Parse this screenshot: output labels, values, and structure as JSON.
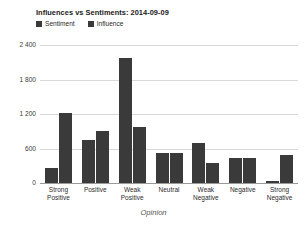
{
  "chart_data": {
    "type": "bar",
    "title": "Influences vs Sentiments: 2014-09-09",
    "xlabel": "Opinion",
    "ylabel": "",
    "ylim": [
      0,
      2400
    ],
    "yticks": [
      0,
      600,
      1200,
      1800,
      2400
    ],
    "ytick_labels": [
      "0",
      "600",
      "1 200",
      "1 800",
      "2 400"
    ],
    "grid": true,
    "legend_position": "top-left",
    "categories": [
      "Strong\nPositive",
      "Positive",
      "Weak\nPositive",
      "Neutral",
      "Weak\nNegative",
      "Negative",
      "Strong\nNegative"
    ],
    "series": [
      {
        "name": "Sentiment",
        "color": "#3a3a3a",
        "values": [
          260,
          750,
          2180,
          520,
          700,
          430,
          30
        ]
      },
      {
        "name": "Influence",
        "color": "#3a3a3a",
        "values": [
          1210,
          900,
          970,
          520,
          350,
          430,
          480
        ]
      }
    ]
  },
  "colors": {
    "bar": "#3a3a3a",
    "gridline": "#d9d9d9",
    "axis": "#9a9a9a",
    "background": "#ffffff",
    "title_text": "#1a1a1a",
    "axis_text": "#3a3a3a",
    "xlabel_text": "#555555"
  }
}
